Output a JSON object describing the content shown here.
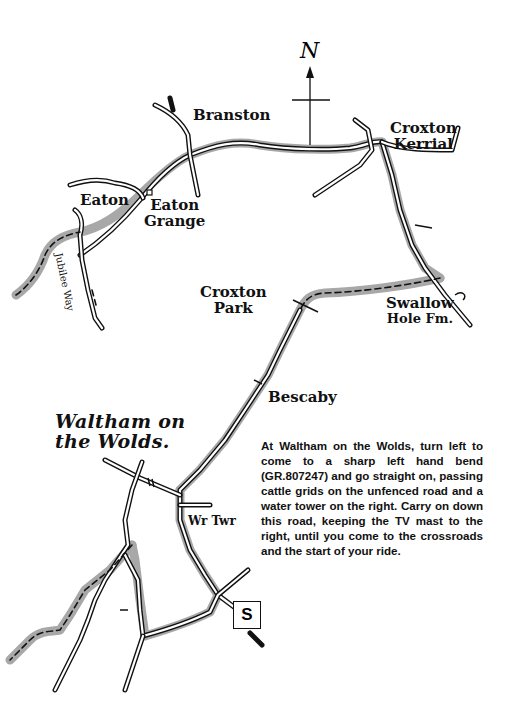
{
  "map": {
    "title": "Route map: Waltham on the Wolds to Croxton Kerrial",
    "north_label": "N",
    "start_marker": "S",
    "places": [
      {
        "id": "branston",
        "name": "Branston"
      },
      {
        "id": "croxton-kerrial",
        "name": "Croxton Kerrial",
        "lines": [
          "Croxton",
          "Kerrial"
        ]
      },
      {
        "id": "eaton",
        "name": "Eaton"
      },
      {
        "id": "eaton-grange",
        "name": "Eaton Grange",
        "lines": [
          "Eaton",
          "Grange"
        ]
      },
      {
        "id": "croxton-park",
        "name": "Croxton Park",
        "lines": [
          "Croxton",
          "Park"
        ]
      },
      {
        "id": "swallow-hole-fm",
        "name": "Swallow Hole Fm.",
        "lines": [
          "Swallow",
          "Hole Fm."
        ]
      },
      {
        "id": "bescaby",
        "name": "Bescaby"
      },
      {
        "id": "waltham-on-the-wolds",
        "name": "Waltham on the Wolds.",
        "lines": [
          "Waltham on",
          "the Wolds."
        ]
      },
      {
        "id": "water-tower",
        "name": "Wr Twr"
      }
    ],
    "path_labels": [
      {
        "id": "jubilee-way",
        "name": "Jubilee Way"
      }
    ],
    "legend": {
      "route_color": "#a8a8a8",
      "road_color": "#111111",
      "background": "#ffffff"
    }
  },
  "directions": {
    "text": "At Waltham on the Wolds, turn left to come to a sharp left hand bend (GR.807247) and go straight on, passing cattle grids on the unfenced road and a water tower on the right. Carry on down this road, keeping the TV mast to the right, until you come to the crossroads and the start of your ride."
  }
}
